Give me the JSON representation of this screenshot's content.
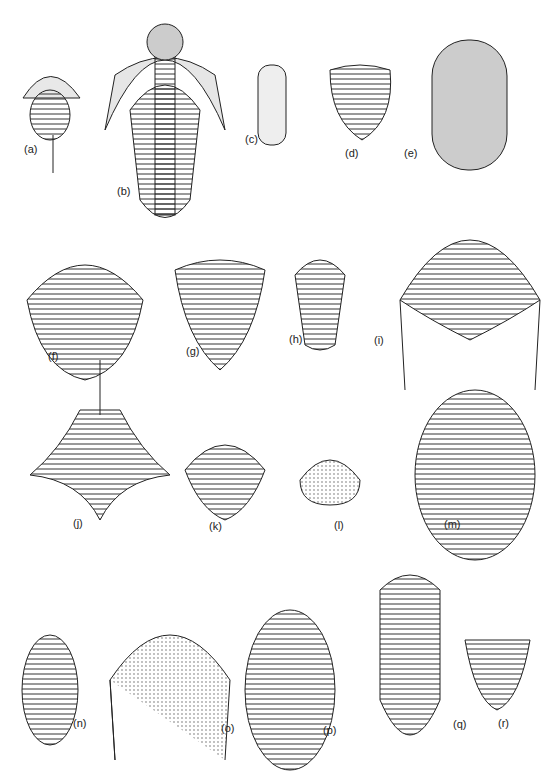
{
  "plate": {
    "labels": [
      "(a)",
      "(b)",
      "(c)",
      "(d)",
      "(e)",
      "(f)",
      "(g)",
      "(h)",
      "(i)",
      "(j)",
      "(k)",
      "(l)",
      "(m)",
      "(n)",
      "(o)",
      "(p)",
      "(q)",
      "(r)"
    ]
  }
}
